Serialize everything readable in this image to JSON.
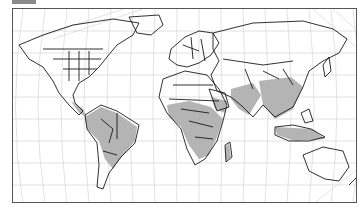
{
  "map": {
    "projection": "robinson-like",
    "graticule": true,
    "colors": {
      "land": "#ffffff",
      "border": "#1a1a1a",
      "shaded_region": "#b4b4b4",
      "graticule": "#c8c8c8",
      "frame": "#555555",
      "tab": "#8a8a8a"
    },
    "shaded_regions": [
      "South America (tropical)",
      "Sub-Saharan Africa",
      "Arabian Peninsula (south)",
      "South Asia",
      "Southeast Asia",
      "Southern China",
      "Maritime Southeast Asia",
      "Madagascar"
    ]
  }
}
